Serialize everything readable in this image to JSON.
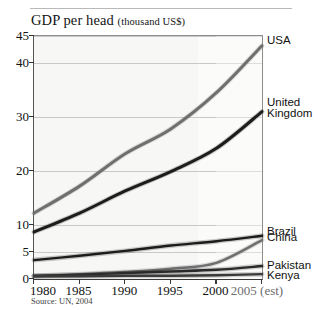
{
  "figure": {
    "title_main": "GDP per head",
    "title_unit": "(thousand US$)",
    "source": "Source: UN, 2004",
    "ghost_top_text": " "
  },
  "chart_data": {
    "type": "line",
    "title": "GDP per head (thousand US$)",
    "xlabel": "",
    "ylabel": "GDP per head (thousand US$)",
    "unit": "thousand US$",
    "source": "Source: UN, 2004",
    "x": [
      1980,
      1985,
      1990,
      1995,
      2000,
      2005
    ],
    "x_tick_labels": [
      "1980",
      "1985",
      "1990",
      "1995",
      "2000",
      "2005 (est)"
    ],
    "xlim": [
      1980,
      2005
    ],
    "ylim": [
      0,
      45
    ],
    "y_ticks": [
      0,
      5,
      10,
      20,
      30,
      40,
      45
    ],
    "y_tick_labels": [
      "0",
      "5",
      "10",
      "20",
      "30",
      "40",
      "45"
    ],
    "grid": true,
    "legend_position": "right-of-plot (series end labels)",
    "forecast_from": 2000,
    "forecast_note": "2005 values are estimates (shaded band right of 2000)",
    "series": [
      {
        "name": "USA",
        "color": "#6f6f6f",
        "values": [
          12.2,
          17.2,
          23.2,
          27.8,
          34.5,
          43.2
        ]
      },
      {
        "name": "United Kingdom",
        "color": "#1c1c1c",
        "values": [
          8.7,
          12.2,
          16.3,
          19.9,
          24.2,
          31.0
        ]
      },
      {
        "name": "Brazil",
        "color": "#1c1c1c",
        "values": [
          3.5,
          4.3,
          5.2,
          6.2,
          7.0,
          8.0
        ]
      },
      {
        "name": "China",
        "color": "#6f6f6f",
        "values": [
          0.5,
          0.9,
          1.3,
          1.9,
          3.0,
          7.2
        ]
      },
      {
        "name": "Pakistan",
        "color": "#2a2a2a",
        "values": [
          0.6,
          0.8,
          1.1,
          1.4,
          1.7,
          2.4
        ]
      },
      {
        "name": "Kenya",
        "color": "#3a3a3a",
        "values": [
          0.5,
          0.5,
          0.6,
          0.6,
          0.7,
          0.9
        ]
      }
    ]
  },
  "series_labels": [
    {
      "name": "USA",
      "lines": [
        "USA"
      ]
    },
    {
      "name": "United Kingdom",
      "lines": [
        "United",
        "Kingdom"
      ]
    },
    {
      "name": "Brazil",
      "lines": [
        "Brazil"
      ]
    },
    {
      "name": "China",
      "lines": [
        "China"
      ]
    },
    {
      "name": "Pakistan",
      "lines": [
        "Pakistan"
      ]
    },
    {
      "name": "Kenya",
      "lines": [
        "Kenya"
      ]
    }
  ]
}
